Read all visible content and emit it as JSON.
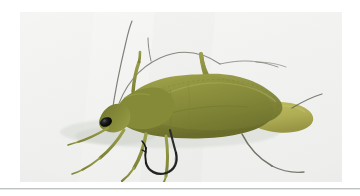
{
  "page": {
    "background_color": "#ffffff",
    "separator_color": "#bfc3c0"
  },
  "photo": {
    "name": "green-hopper-fly-photograph",
    "alt_text": "Green foam-body hopper fishing fly tied on a hook",
    "background_color": "#f2f3f1",
    "frame": {
      "x": 20,
      "y": 12,
      "width": 322,
      "height": 170
    }
  },
  "subject": {
    "label": "hopper-fly",
    "body_color": "#8a8f38",
    "body_highlight_color": "#a7a94e",
    "body_shadow_color": "#6d7030",
    "tail_color": "#b2b057",
    "leg_color": "#8d9042",
    "antenna_color": "#6f6f66",
    "eye_color": "#101010",
    "hook_color": "#2a2a2a",
    "orientation": "facing-left"
  },
  "parts": [
    {
      "name": "head",
      "color": "#7f8436"
    },
    {
      "name": "eye",
      "color": "#0c0c0c"
    },
    {
      "name": "thorax",
      "color": "#8a8f38"
    },
    {
      "name": "abdomen",
      "color": "#96993f"
    },
    {
      "name": "wing-case",
      "color": "#8f9340"
    },
    {
      "name": "tail-lobe",
      "color": "#b2b057"
    },
    {
      "name": "foreleg",
      "color": "#8d9042"
    },
    {
      "name": "midleg",
      "color": "#8d9042"
    },
    {
      "name": "hindleg",
      "color": "#5c5c50"
    },
    {
      "name": "antenna-left",
      "color": "#6f6f66"
    },
    {
      "name": "antenna-right",
      "color": "#6f6f66"
    },
    {
      "name": "hook-shank",
      "color": "#262626"
    },
    {
      "name": "hook-bend",
      "color": "#1d1d1d"
    },
    {
      "name": "hook-point",
      "color": "#141414"
    }
  ]
}
